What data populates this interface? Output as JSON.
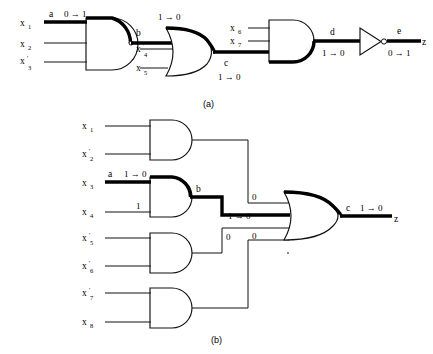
{
  "figure": {
    "captions": {
      "a": "(a)",
      "b": "(b)"
    }
  },
  "diagram_a": {
    "inputs": [
      {
        "name": "x1",
        "label": "x",
        "sub": "1"
      },
      {
        "name": "x2",
        "label": "x",
        "sub": "2"
      },
      {
        "name": "x3prime",
        "label": "x'",
        "sub": "3"
      },
      {
        "name": "x4prime",
        "label": "x'",
        "sub": "4"
      },
      {
        "name": "x5",
        "label": "x",
        "sub": "5"
      },
      {
        "name": "x6",
        "label": "x",
        "sub": "6"
      },
      {
        "name": "x7",
        "label": "x",
        "sub": "7"
      }
    ],
    "gates": [
      {
        "name": "and-gate-1",
        "type": "AND",
        "inputs": [
          "x1",
          "x2",
          "x3prime"
        ],
        "output": "b"
      },
      {
        "name": "or-gate-1",
        "type": "OR",
        "inputs": [
          "b",
          "x4prime",
          "x5"
        ],
        "output": "c"
      },
      {
        "name": "and-gate-2",
        "type": "AND",
        "inputs": [
          "x6",
          "x7",
          "c"
        ],
        "output": "d"
      },
      {
        "name": "inverter-1",
        "type": "NOT",
        "inputs": [
          "d"
        ],
        "output": "e"
      }
    ],
    "signal_labels": [
      {
        "name": "signal-a",
        "label": "a",
        "transition": "0 → 1"
      },
      {
        "name": "signal-b",
        "label": "b",
        "transition": "1 → 0"
      },
      {
        "name": "signal-c",
        "label": "c",
        "transition": "1 → 0"
      },
      {
        "name": "signal-d",
        "label": "d",
        "transition": "1 → 0"
      },
      {
        "name": "signal-e",
        "label": "e",
        "transition": "0 → 1"
      }
    ],
    "output": {
      "name": "output-z",
      "label": "z"
    }
  },
  "diagram_b": {
    "inputs": [
      {
        "name": "x1",
        "label": "x",
        "sub": "1"
      },
      {
        "name": "x2prime",
        "label": "x'",
        "sub": "2"
      },
      {
        "name": "x3",
        "label": "x",
        "sub": "3"
      },
      {
        "name": "x4",
        "label": "x",
        "sub": "4"
      },
      {
        "name": "x5prime",
        "label": "x'",
        "sub": "5"
      },
      {
        "name": "x6prime",
        "label": "x'",
        "sub": "6"
      },
      {
        "name": "x7prime",
        "label": "x'",
        "sub": "7"
      },
      {
        "name": "x8",
        "label": "x",
        "sub": "8"
      }
    ],
    "gates": [
      {
        "name": "and-gate-1",
        "type": "AND",
        "inputs": [
          "x1",
          "x2prime"
        ]
      },
      {
        "name": "and-gate-2",
        "type": "AND",
        "inputs": [
          "x3",
          "x4"
        ],
        "output": "b"
      },
      {
        "name": "and-gate-3",
        "type": "AND",
        "inputs": [
          "x5prime",
          "x6prime"
        ]
      },
      {
        "name": "and-gate-4",
        "type": "AND",
        "inputs": [
          "x7prime",
          "x8"
        ]
      },
      {
        "name": "or-gate-1",
        "type": "OR",
        "output": "c"
      }
    ],
    "signal_labels": [
      {
        "name": "signal-a",
        "label": "a",
        "transition": "1 → 0"
      },
      {
        "name": "signal-b",
        "label": "b",
        "transition": ""
      },
      {
        "name": "signal-c",
        "label": "c",
        "transition": "1 → 0"
      }
    ],
    "wire_values": [
      {
        "name": "value-x4-line",
        "value": "1"
      },
      {
        "name": "value-or-input-1",
        "value": "0"
      },
      {
        "name": "value-or-input-2",
        "value": "1 → 0"
      },
      {
        "name": "value-or-input-3",
        "value": "0"
      },
      {
        "name": "value-or-input-4",
        "value": "0"
      }
    ],
    "output": {
      "name": "output-z",
      "label": "z"
    }
  },
  "colors": {
    "ink": "#111111",
    "bold_ink": "#000000",
    "background": "#ffffff"
  }
}
